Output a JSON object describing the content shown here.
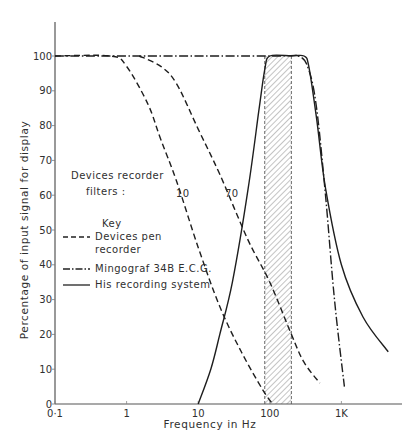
{
  "chart_data": {
    "type": "line",
    "title": "",
    "xlabel": "Frequency in Hz",
    "ylabel": "Percentage of input signal for display",
    "xscale": "log",
    "xlim": [
      0.1,
      5000
    ],
    "ylim": [
      0,
      100
    ],
    "x_ticks": [
      "0·1",
      "1",
      "10",
      "100",
      "1K"
    ],
    "y_ticks": [
      "0",
      "10",
      "20",
      "30",
      "40",
      "50",
      "60",
      "70",
      "80",
      "90",
      "100"
    ],
    "grid": false,
    "annotations": {
      "filters_heading": "Devices recorder",
      "filters_heading_line2": "filters :",
      "filter_10_label": "10",
      "filter_70_label": "70",
      "shaded_band_hz": [
        85,
        200
      ]
    },
    "legend": {
      "title": "Key",
      "position": "inside-left",
      "entries": [
        {
          "name": "Devices pen",
          "name_line2": "recorder",
          "style": "dashed"
        },
        {
          "name": "Mingograf 34B E.C.G.",
          "style": "dash-dot"
        },
        {
          "name": "His recording system",
          "style": "solid"
        }
      ]
    },
    "series": [
      {
        "name": "Devices pen recorder (10 Hz filter)",
        "style": "dashed",
        "x": [
          0.1,
          0.6,
          1,
          2,
          3,
          5,
          10,
          20,
          40,
          80,
          110
        ],
        "y": [
          100,
          100,
          97,
          86,
          76,
          64,
          45,
          28,
          15,
          4,
          0
        ]
      },
      {
        "name": "Devices pen recorder (70 Hz filter)",
        "style": "dashed",
        "x": [
          1.5,
          3,
          5,
          10,
          20,
          50,
          100,
          200,
          300,
          500
        ],
        "y": [
          100,
          97,
          92,
          79,
          66,
          47,
          35,
          20,
          12,
          6
        ]
      },
      {
        "name": "Mingograf 34B E.C.G.",
        "style": "dash-dot",
        "x": [
          0.1,
          100,
          250,
          350,
          450,
          600,
          800,
          1100
        ],
        "y": [
          100,
          100,
          100,
          96,
          85,
          60,
          30,
          5
        ]
      },
      {
        "name": "His recording system",
        "style": "solid",
        "x": [
          10,
          15,
          20,
          30,
          50,
          70,
          85,
          100,
          200,
          300,
          350,
          450,
          600,
          1000,
          2000,
          4500
        ],
        "y": [
          0,
          10,
          20,
          35,
          62,
          84,
          96,
          100,
          100,
          100,
          97,
          82,
          62,
          40,
          25,
          15
        ]
      }
    ]
  }
}
